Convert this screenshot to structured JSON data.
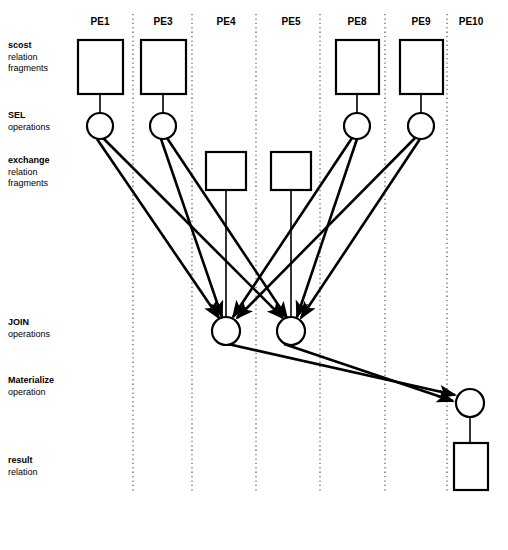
{
  "figure": {
    "type": "diagram",
    "background_color": "#ffffff",
    "stroke_color": "#000000",
    "divider_color": "#555555"
  },
  "columns": {
    "label_prefix": "PE",
    "items": [
      {
        "id": "PE1",
        "label": "PE1",
        "center_x": 100,
        "divider_right_x": 133
      },
      {
        "id": "PE3",
        "label": "PE3",
        "center_x": 163,
        "divider_right_x": 192
      },
      {
        "id": "PE4",
        "label": "PE4",
        "center_x": 226,
        "divider_right_x": 256
      },
      {
        "id": "PE5",
        "label": "PE5",
        "center_x": 291,
        "divider_right_x": 320
      },
      {
        "id": "PE8",
        "label": "PE8",
        "center_x": 357,
        "divider_right_x": 385
      },
      {
        "id": "PE9",
        "label": "PE9",
        "center_x": 421,
        "divider_right_x": 447
      },
      {
        "id": "PE10",
        "label": "PE10",
        "center_x": 471,
        "divider_right_x": null
      }
    ],
    "label_y": 16,
    "divider_top_y": 14,
    "divider_bottom_y": 492
  },
  "row_labels": [
    {
      "id": "scost",
      "lead": "scost",
      "rest": [
        "relation",
        "fragments"
      ],
      "y": 40
    },
    {
      "id": "sel",
      "lead": "SEL",
      "rest": [
        "operations"
      ],
      "y": 110
    },
    {
      "id": "exchange",
      "lead": "exchange",
      "rest": [
        "relation",
        "fragments"
      ],
      "y": 155
    },
    {
      "id": "join",
      "lead": "JOIN",
      "rest": [
        "operations"
      ],
      "y": 317
    },
    {
      "id": "materialize",
      "lead": "Materialize",
      "rest": [
        "operation"
      ],
      "y": 375
    },
    {
      "id": "result",
      "lead": "result",
      "rest": [
        "relation"
      ],
      "y": 455
    }
  ],
  "nodes": {
    "scost_fragments": [
      {
        "id": "scost-PE1",
        "pe": "PE1",
        "x": 78,
        "y": 40,
        "w": 45,
        "h": 54
      },
      {
        "id": "scost-PE3",
        "pe": "PE3",
        "x": 141,
        "y": 40,
        "w": 45,
        "h": 54
      },
      {
        "id": "scost-PE8",
        "pe": "PE8",
        "x": 336,
        "y": 40,
        "w": 43,
        "h": 54
      },
      {
        "id": "scost-PE9",
        "pe": "PE9",
        "x": 400,
        "y": 40,
        "w": 43,
        "h": 54
      }
    ],
    "sel_operations": [
      {
        "id": "sel-PE1",
        "pe": "PE1",
        "cx": 100,
        "cy": 126,
        "r": 13
      },
      {
        "id": "sel-PE3",
        "pe": "PE3",
        "cx": 163,
        "cy": 126,
        "r": 13
      },
      {
        "id": "sel-PE8",
        "pe": "PE8",
        "cx": 357,
        "cy": 126,
        "r": 13
      },
      {
        "id": "sel-PE9",
        "pe": "PE9",
        "cx": 421,
        "cy": 126,
        "r": 13
      }
    ],
    "exchange_fragments": [
      {
        "id": "exchange-PE4",
        "pe": "PE4",
        "x": 206,
        "y": 152,
        "w": 40,
        "h": 38
      },
      {
        "id": "exchange-PE5",
        "pe": "PE5",
        "x": 271,
        "y": 152,
        "w": 40,
        "h": 38
      }
    ],
    "join_operations": [
      {
        "id": "join-PE4",
        "pe": "PE4",
        "cx": 226,
        "cy": 331,
        "r": 14
      },
      {
        "id": "join-PE5",
        "pe": "PE5",
        "cx": 291,
        "cy": 331,
        "r": 14
      }
    ],
    "materialize_operations": [
      {
        "id": "materialize-PE10",
        "pe": "PE10",
        "cx": 470,
        "cy": 403,
        "r": 14
      }
    ],
    "result_relations": [
      {
        "id": "result-PE10",
        "pe": "PE10",
        "x": 454,
        "y": 443,
        "w": 34,
        "h": 47
      }
    ]
  },
  "edges": {
    "plain_lines": [
      {
        "id": "scost-PE1-to-sel-PE1",
        "x1": 100,
        "y1": 94,
        "x2": 100,
        "y2": 113
      },
      {
        "id": "scost-PE3-to-sel-PE3",
        "x1": 163,
        "y1": 94,
        "x2": 163,
        "y2": 113
      },
      {
        "id": "scost-PE8-to-sel-PE8",
        "x1": 357,
        "y1": 94,
        "x2": 357,
        "y2": 113
      },
      {
        "id": "scost-PE9-to-sel-PE9",
        "x1": 421,
        "y1": 94,
        "x2": 421,
        "y2": 113
      },
      {
        "id": "exchange-PE4-to-join-PE4",
        "x1": 226,
        "y1": 190,
        "x2": 226,
        "y2": 317
      },
      {
        "id": "exchange-PE5-to-join-PE5",
        "x1": 291,
        "y1": 190,
        "x2": 291,
        "y2": 317
      },
      {
        "id": "materialize-PE10-to-result-PE10",
        "x1": 470,
        "y1": 417,
        "x2": 470,
        "y2": 443
      }
    ],
    "arrows": [
      {
        "id": "sel-PE1-to-join-PE4",
        "from": "sel-PE1",
        "to": "join-PE4",
        "x1": 97,
        "y1": 139,
        "x2": 219,
        "y2": 318
      },
      {
        "id": "sel-PE1-to-join-PE5",
        "from": "sel-PE1",
        "to": "join-PE5",
        "x1": 103,
        "y1": 138,
        "x2": 283,
        "y2": 318
      },
      {
        "id": "sel-PE3-to-join-PE4",
        "from": "sel-PE3",
        "to": "join-PE4",
        "x1": 161,
        "y1": 139,
        "x2": 222,
        "y2": 317
      },
      {
        "id": "sel-PE3-to-join-PE5",
        "from": "sel-PE3",
        "to": "join-PE5",
        "x1": 167,
        "y1": 138,
        "x2": 287,
        "y2": 318
      },
      {
        "id": "sel-PE8-to-join-PE4",
        "from": "sel-PE8",
        "to": "join-PE4",
        "x1": 352,
        "y1": 138,
        "x2": 233,
        "y2": 317
      },
      {
        "id": "sel-PE8-to-join-PE5",
        "from": "sel-PE8",
        "to": "join-PE5",
        "x1": 357,
        "y1": 139,
        "x2": 297,
        "y2": 317
      },
      {
        "id": "sel-PE9-to-join-PE4",
        "from": "sel-PE9",
        "to": "join-PE4",
        "x1": 415,
        "y1": 138,
        "x2": 237,
        "y2": 318
      },
      {
        "id": "sel-PE9-to-join-PE5",
        "from": "sel-PE9",
        "to": "join-PE5",
        "x1": 420,
        "y1": 139,
        "x2": 301,
        "y2": 318
      },
      {
        "id": "join-PE4-to-materialize-PE10",
        "from": "join-PE4",
        "to": "materialize-PE10",
        "x1": 219,
        "y1": 342,
        "x2": 455,
        "y2": 395
      },
      {
        "id": "join-PE5-to-materialize-PE10",
        "from": "join-PE5",
        "to": "materialize-PE10",
        "x1": 284,
        "y1": 344,
        "x2": 453,
        "y2": 401
      }
    ]
  }
}
